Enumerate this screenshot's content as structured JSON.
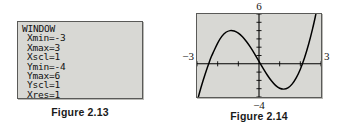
{
  "figure_window": {
    "caption": "Figure 2.13",
    "screen_title": "WINDOW",
    "settings": [
      {
        "label": "Xmin=-3"
      },
      {
        "label": "Xmax=3"
      },
      {
        "label": "Xscl=1"
      },
      {
        "label": "Ymin=-4"
      },
      {
        "label": "Ymax=6"
      },
      {
        "label": "Yscl=1"
      },
      {
        "label": "Xres=1"
      }
    ]
  },
  "figure_graph": {
    "caption": "Figure 2.14",
    "labels": {
      "top": "6",
      "bottom": "−4",
      "left": "−3",
      "right": "3"
    }
  },
  "colors": {
    "screen_fill": "#d8d8d4",
    "screen_border": "#5a5a58",
    "curve": "#000000",
    "axis": "#000000",
    "text": "#111111"
  },
  "chart_data": {
    "type": "line",
    "title": "Figure 2.14",
    "xlabel": "",
    "ylabel": "",
    "xlim": [
      -3,
      3
    ],
    "ylim": [
      -4,
      6
    ],
    "xscl": 1,
    "yscl": 1,
    "grid": false,
    "legend": null,
    "axis_labels": {
      "top": 6,
      "bottom": -4,
      "left": -3,
      "right": 3
    },
    "series": [
      {
        "name": "cubic",
        "points": [
          [
            -3.0,
            -4.6
          ],
          [
            -2.8,
            -2.8
          ],
          [
            -2.6,
            -1.2
          ],
          [
            -2.4,
            0.25
          ],
          [
            -2.3,
            0.9
          ],
          [
            -2.2,
            1.45
          ],
          [
            -2.0,
            2.5
          ],
          [
            -1.8,
            3.3
          ],
          [
            -1.6,
            3.8
          ],
          [
            -1.4,
            4.0
          ],
          [
            -1.2,
            3.95
          ],
          [
            -1.0,
            3.7
          ],
          [
            -0.8,
            3.25
          ],
          [
            -0.6,
            2.65
          ],
          [
            -0.4,
            1.95
          ],
          [
            -0.2,
            1.15
          ],
          [
            0.0,
            0.3
          ],
          [
            0.2,
            -0.55
          ],
          [
            0.4,
            -1.35
          ],
          [
            0.6,
            -2.05
          ],
          [
            0.8,
            -2.6
          ],
          [
            1.0,
            -2.95
          ],
          [
            1.2,
            -3.05
          ],
          [
            1.4,
            -2.9
          ],
          [
            1.6,
            -2.45
          ],
          [
            1.8,
            -1.7
          ],
          [
            2.0,
            -0.65
          ],
          [
            2.2,
            0.7
          ],
          [
            2.4,
            2.35
          ],
          [
            2.6,
            4.3
          ],
          [
            2.75,
            5.95
          ]
        ],
        "features": {
          "local_max": [
            -1.4,
            4.0
          ],
          "local_min": [
            1.2,
            -3.05
          ],
          "x_intercepts": [
            -2.45,
            0.07,
            2.13
          ]
        }
      }
    ]
  }
}
